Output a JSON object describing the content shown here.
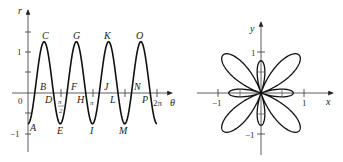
{
  "left_graph": {
    "title": "Cartesian graph of r versus theta",
    "axis_x_label": "θ",
    "axis_y_label": "r",
    "origin_label": "0",
    "y_ticks": [
      {
        "value": 1,
        "label": "1"
      },
      {
        "value": -1,
        "label": "−1"
      },
      {
        "value": 1.5,
        "label": ""
      }
    ],
    "x_ticks": [
      {
        "value": "pi/2",
        "label": "π/2",
        "num": "π",
        "den": "2"
      },
      {
        "value": "pi",
        "label": "π"
      },
      {
        "value": "3pi/2",
        "label": ""
      },
      {
        "value": "2pi",
        "label": "2π"
      }
    ],
    "point_labels": [
      "A",
      "B",
      "C",
      "D",
      "E",
      "F",
      "G",
      "H",
      "I",
      "J",
      "K",
      "L",
      "M",
      "N",
      "O",
      "P"
    ]
  },
  "right_graph": {
    "title": "Polar rose curve",
    "axis_x_label": "x",
    "axis_y_label": "y",
    "x_ticks": [
      {
        "value": -1,
        "label": "−1"
      },
      {
        "value": 1,
        "label": "1"
      }
    ],
    "y_ticks": [
      {
        "value": 1,
        "label": "1"
      },
      {
        "value": -1,
        "label": "−1"
      }
    ]
  },
  "curve": {
    "equation": "r = 1/4 − cos 4θ",
    "max_r": 1.25,
    "min_r": -0.75,
    "color": "#111111"
  },
  "labels": {
    "A": "A",
    "B": "B",
    "C": "C",
    "D": "D",
    "E": "E",
    "F": "F",
    "G": "G",
    "H": "H",
    "I": "I",
    "J": "J",
    "K": "K",
    "L": "L",
    "M": "M",
    "N": "N",
    "O": "O",
    "P": "P",
    "r": "r",
    "theta": "θ",
    "x": "x",
    "y": "y",
    "zero": "0",
    "one": "1",
    "neg_one": "−1",
    "pi": "π",
    "two": "2",
    "two_pi": "2π"
  }
}
